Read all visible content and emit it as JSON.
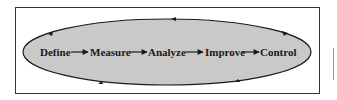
{
  "diagram": {
    "steps": [
      {
        "label": "Define",
        "x": 40
      },
      {
        "label": "Measure",
        "x": 90
      },
      {
        "label": "Analyze",
        "x": 148
      },
      {
        "label": "Improve",
        "x": 205
      },
      {
        "label": "Control",
        "x": 260
      }
    ],
    "colors": {
      "ellipse_fill": "#c9c9c9",
      "stroke": "#1a1a1a",
      "frame": "#333333"
    }
  }
}
